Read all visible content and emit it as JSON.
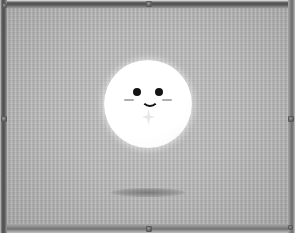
{
  "scene": {
    "title": "Floating mascot on textured panel",
    "background_color": "#b4b4b4",
    "frame_color": "#5d5d5d"
  },
  "panel": {
    "name": "display-panel",
    "bezel": {
      "top_label": "top-bezel",
      "bottom_label": "bottom-bezel",
      "left_label": "left-bezel",
      "right_label": "right-bezel"
    },
    "screws": [
      {
        "id": "screw-top-center",
        "position": "top-center"
      },
      {
        "id": "screw-bottom-center",
        "position": "bottom-center"
      },
      {
        "id": "screw-left-mid",
        "position": "left-middle"
      },
      {
        "id": "screw-right-mid",
        "position": "right-middle"
      },
      {
        "id": "screw-top-left",
        "position": "top-left"
      },
      {
        "id": "screw-bottom-right",
        "position": "bottom-right"
      }
    ]
  },
  "character": {
    "name": "mascot",
    "shape": "circle",
    "body_color": "#ffffff",
    "eye_color": "#141414",
    "blush_color": "#6e6e6e",
    "expression": "smiling",
    "features": {
      "left_eye": "left-eye",
      "right_eye": "right-eye",
      "left_blush": "left-blush",
      "right_blush": "right-blush",
      "mouth": "smile-mouth",
      "sparkle": "sparkle-icon"
    }
  },
  "shadow": {
    "name": "character-shadow",
    "color": "#5a5a5a"
  }
}
